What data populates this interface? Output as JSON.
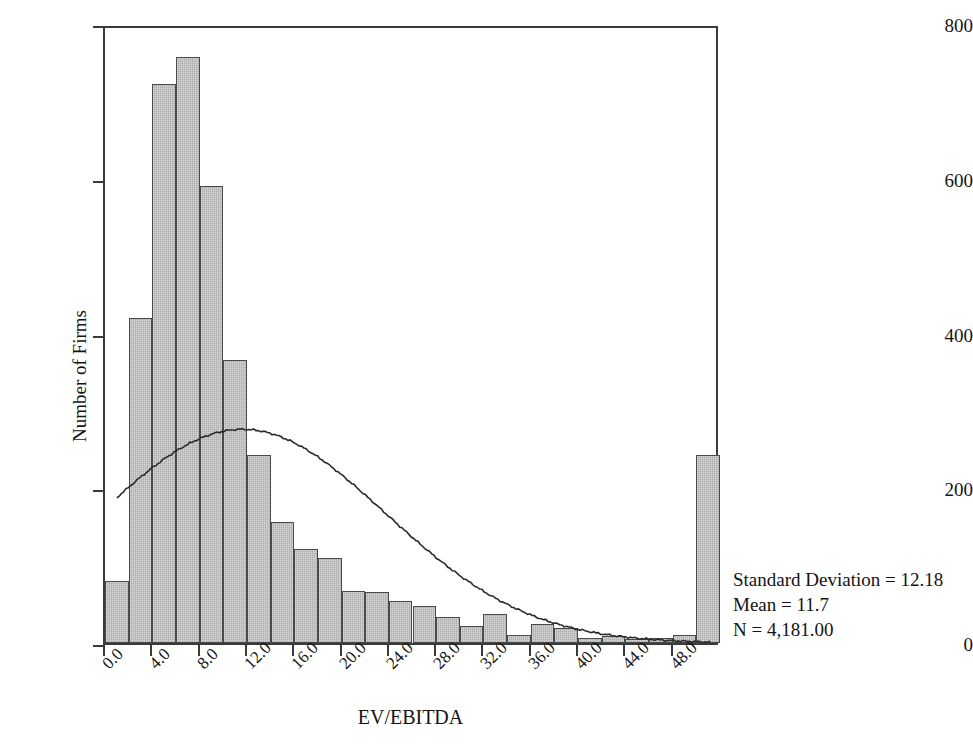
{
  "chart_data": {
    "type": "bar",
    "title": "",
    "subtitle": "",
    "xlabel": "EV/EBITDA",
    "ylabel": "Number of Firms",
    "xlim": [
      0,
      52
    ],
    "ylim": [
      0,
      800
    ],
    "grid": false,
    "legend": null,
    "bin_width": 2.0,
    "x_tick_labels": [
      "0.0",
      "4.0",
      "8.0",
      "12.0",
      "16.0",
      "20.0",
      "24.0",
      "28.0",
      "32.0",
      "36.0",
      "40.0",
      "44.0",
      "48.0"
    ],
    "x_tick_values": [
      0,
      4,
      8,
      12,
      16,
      20,
      24,
      28,
      32,
      36,
      40,
      44,
      48
    ],
    "y_tick_labels": [
      "0",
      "200",
      "400",
      "600",
      "800"
    ],
    "y_tick_values": [
      0,
      200,
      400,
      600,
      800
    ],
    "bin_centers": [
      1,
      3,
      5,
      7,
      9,
      11,
      13,
      15,
      17,
      19,
      21,
      23,
      25,
      27,
      29,
      31,
      33,
      35,
      37,
      39,
      41,
      43,
      45,
      47,
      49,
      51
    ],
    "values": [
      80,
      420,
      722,
      758,
      591,
      366,
      243,
      156,
      122,
      110,
      67,
      66,
      54,
      48,
      33,
      22,
      37,
      10,
      25,
      19,
      7,
      9,
      5,
      6,
      11,
      243
    ],
    "overlay_curve": {
      "name": "normal-distribution-curve",
      "mean": 11.7,
      "std_dev": 12.18,
      "n": 4181,
      "peak_value": 278,
      "x_start": 1.0,
      "x_end": 51.5
    },
    "annotations": {
      "std_dev_label": "Standard Deviation = 12.18",
      "mean_label": "Mean = 11.7",
      "n_label": "N = 4,181.00"
    },
    "colors": {
      "bar_fill": "#b6b6b6",
      "bar_stroke": "#4a4a4a",
      "axis": "#3a3a3a",
      "curve": "#2b2b2b",
      "text": "#141414",
      "background": "#ffffff"
    }
  },
  "stats": {
    "std_dev": "Standard Deviation = 12.18",
    "mean": "Mean = 11.7",
    "n": "N = 4,181.00"
  },
  "axes": {
    "x_title": "EV/EBITDA",
    "y_title": "Number of Firms"
  }
}
